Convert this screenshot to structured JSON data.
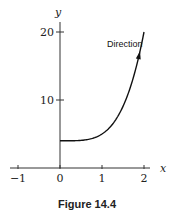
{
  "caption": "Figure 14.4",
  "chart_data": {
    "type": "line",
    "title": "",
    "xlabel": "x",
    "ylabel": "y",
    "xlim": [
      -1.1,
      2.2
    ],
    "ylim": [
      0,
      22
    ],
    "xticks": [
      -1,
      0,
      1,
      2
    ],
    "xtick_labels": [
      "−1",
      "0",
      "1",
      "2"
    ],
    "yticks": [
      10,
      20
    ],
    "ytick_labels": [
      "10",
      "20"
    ],
    "grid": false,
    "series": [
      {
        "name": "curve",
        "x": [
          0,
          0.25,
          0.5,
          0.75,
          1.0,
          1.25,
          1.5,
          1.75,
          2.0
        ],
        "y": [
          4,
          4.0,
          4.06,
          4.32,
          5,
          6.44,
          9.06,
          13.38,
          20
        ],
        "color": "#111111",
        "arrow_at": 1.9
      }
    ],
    "annotations": [
      {
        "text": "Direction",
        "x": 1.28,
        "y": 18.5
      }
    ]
  }
}
